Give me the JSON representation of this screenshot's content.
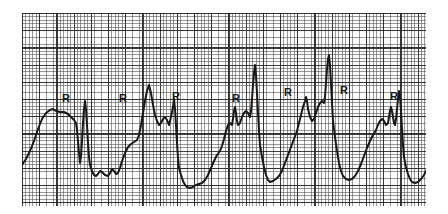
{
  "figure": {
    "kind": "ecg-rhythm-strip",
    "paper": {
      "background_color": "#fbfbfb",
      "minor_grid_color": "#3c3c3c",
      "major_grid_color": "#191919",
      "minor_grid_spacing_px": 3.44,
      "major_grid_every": 5,
      "left_px": 22,
      "top_px": 13,
      "width_px": 404,
      "height_px": 193
    },
    "trace": {
      "color": "#0a0a0a",
      "stroke_width_px": 2.0,
      "annotation_letter": "R",
      "annotation_count": 7
    }
  },
  "annotations": [
    {
      "label": "R",
      "x": 40,
      "y": 80
    },
    {
      "label": "R",
      "x": 97,
      "y": 80
    },
    {
      "label": "R",
      "x": 150,
      "y": 78
    },
    {
      "label": "R",
      "x": 210,
      "y": 80
    },
    {
      "label": "R",
      "x": 262,
      "y": 74
    },
    {
      "label": "R",
      "x": 318,
      "y": 72
    },
    {
      "label": "R",
      "x": 368,
      "y": 78
    }
  ],
  "chart_data": {
    "type": "line",
    "title": "",
    "xlabel": "",
    "ylabel": "",
    "xlim": [
      0,
      404
    ],
    "ylim": [
      0,
      193
    ],
    "grid": true,
    "legend": "none",
    "series": [
      {
        "name": "ecg-trace",
        "points": [
          [
            0,
            152
          ],
          [
            4,
            146
          ],
          [
            8,
            138
          ],
          [
            12,
            128
          ],
          [
            16,
            116
          ],
          [
            20,
            106
          ],
          [
            24,
            100
          ],
          [
            28,
            97
          ],
          [
            31,
            96
          ],
          [
            34,
            98
          ],
          [
            38,
            99
          ],
          [
            42,
            99
          ],
          [
            46,
            101
          ],
          [
            49,
            104
          ],
          [
            52,
            107
          ],
          [
            54,
            110
          ],
          [
            55,
            117
          ],
          [
            56,
            128
          ],
          [
            57,
            140
          ],
          [
            58,
            150
          ],
          [
            59,
            143
          ],
          [
            60,
            128
          ],
          [
            61,
            110
          ],
          [
            62,
            96
          ],
          [
            63,
            88
          ],
          [
            64,
            96
          ],
          [
            65,
            112
          ],
          [
            66,
            130
          ],
          [
            67,
            144
          ],
          [
            68,
            152
          ],
          [
            70,
            158
          ],
          [
            72,
            162
          ],
          [
            74,
            163
          ],
          [
            76,
            161
          ],
          [
            78,
            158
          ],
          [
            80,
            159
          ],
          [
            83,
            162
          ],
          [
            86,
            163
          ],
          [
            88,
            160
          ],
          [
            90,
            156
          ],
          [
            92,
            158
          ],
          [
            94,
            161
          ],
          [
            96,
            160
          ],
          [
            98,
            155
          ],
          [
            100,
            148
          ],
          [
            103,
            140
          ],
          [
            106,
            134
          ],
          [
            109,
            131
          ],
          [
            112,
            129
          ],
          [
            115,
            127
          ],
          [
            117,
            122
          ],
          [
            119,
            112
          ],
          [
            121,
            100
          ],
          [
            123,
            88
          ],
          [
            125,
            78
          ],
          [
            127,
            72
          ],
          [
            129,
            80
          ],
          [
            131,
            92
          ],
          [
            133,
            102
          ],
          [
            135,
            108
          ],
          [
            137,
            112
          ],
          [
            139,
            110
          ],
          [
            141,
            106
          ],
          [
            143,
            104
          ],
          [
            145,
            107
          ],
          [
            147,
            112
          ],
          [
            149,
            104
          ],
          [
            151,
            94
          ],
          [
            152,
            86
          ],
          [
            153,
            96
          ],
          [
            154,
            112
          ],
          [
            155,
            130
          ],
          [
            156,
            145
          ],
          [
            157,
            155
          ],
          [
            159,
            162
          ],
          [
            161,
            168
          ],
          [
            163,
            172
          ],
          [
            165,
            174
          ],
          [
            168,
            175
          ],
          [
            171,
            174
          ],
          [
            174,
            172
          ],
          [
            177,
            171
          ],
          [
            180,
            170
          ],
          [
            183,
            167
          ],
          [
            186,
            162
          ],
          [
            189,
            155
          ],
          [
            192,
            148
          ],
          [
            195,
            142
          ],
          [
            198,
            138
          ],
          [
            200,
            133
          ],
          [
            202,
            126
          ],
          [
            204,
            118
          ],
          [
            206,
            112
          ],
          [
            208,
            110
          ],
          [
            210,
            112
          ],
          [
            211,
            106
          ],
          [
            212,
            98
          ],
          [
            213,
            94
          ],
          [
            214,
            100
          ],
          [
            215,
            108
          ],
          [
            216,
            112
          ],
          [
            218,
            110
          ],
          [
            220,
            104
          ],
          [
            222,
            100
          ],
          [
            224,
            98
          ],
          [
            226,
            100
          ],
          [
            228,
            104
          ],
          [
            229,
            98
          ],
          [
            230,
            86
          ],
          [
            231,
            72
          ],
          [
            232,
            60
          ],
          [
            233,
            52
          ],
          [
            234,
            62
          ],
          [
            235,
            80
          ],
          [
            236,
            100
          ],
          [
            237,
            118
          ],
          [
            238,
            132
          ],
          [
            240,
            144
          ],
          [
            242,
            154
          ],
          [
            244,
            162
          ],
          [
            246,
            167
          ],
          [
            248,
            169
          ],
          [
            251,
            168
          ],
          [
            254,
            166
          ],
          [
            257,
            163
          ],
          [
            260,
            158
          ],
          [
            263,
            150
          ],
          [
            266,
            142
          ],
          [
            269,
            134
          ],
          [
            272,
            126
          ],
          [
            275,
            118
          ],
          [
            277,
            110
          ],
          [
            279,
            102
          ],
          [
            281,
            94
          ],
          [
            283,
            88
          ],
          [
            284,
            84
          ],
          [
            285,
            88
          ],
          [
            286,
            96
          ],
          [
            288,
            104
          ],
          [
            290,
            108
          ],
          [
            292,
            106
          ],
          [
            294,
            100
          ],
          [
            296,
            94
          ],
          [
            298,
            90
          ],
          [
            300,
            88
          ],
          [
            302,
            90
          ],
          [
            303,
            84
          ],
          [
            304,
            70
          ],
          [
            305,
            56
          ],
          [
            306,
            46
          ],
          [
            307,
            42
          ],
          [
            308,
            52
          ],
          [
            309,
            70
          ],
          [
            310,
            90
          ],
          [
            311,
            108
          ],
          [
            313,
            124
          ],
          [
            315,
            138
          ],
          [
            317,
            150
          ],
          [
            319,
            158
          ],
          [
            321,
            163
          ],
          [
            324,
            166
          ],
          [
            327,
            167
          ],
          [
            330,
            166
          ],
          [
            333,
            163
          ],
          [
            336,
            158
          ],
          [
            339,
            151
          ],
          [
            342,
            143
          ],
          [
            345,
            135
          ],
          [
            348,
            128
          ],
          [
            351,
            122
          ],
          [
            354,
            117
          ],
          [
            356,
            112
          ],
          [
            358,
            108
          ],
          [
            360,
            106
          ],
          [
            362,
            108
          ],
          [
            364,
            112
          ],
          [
            366,
            110
          ],
          [
            367,
            104
          ],
          [
            368,
            98
          ],
          [
            369,
            94
          ],
          [
            370,
            98
          ],
          [
            371,
            104
          ],
          [
            372,
            110
          ],
          [
            373,
            112
          ],
          [
            374,
            106
          ],
          [
            375,
            96
          ],
          [
            376,
            86
          ],
          [
            377,
            78
          ],
          [
            378,
            84
          ],
          [
            379,
            98
          ],
          [
            380,
            116
          ],
          [
            381,
            132
          ],
          [
            382,
            144
          ],
          [
            384,
            154
          ],
          [
            386,
            161
          ],
          [
            388,
            166
          ],
          [
            390,
            169
          ],
          [
            393,
            170
          ],
          [
            396,
            169
          ],
          [
            399,
            166
          ],
          [
            402,
            162
          ],
          [
            404,
            158
          ]
        ]
      }
    ]
  }
}
